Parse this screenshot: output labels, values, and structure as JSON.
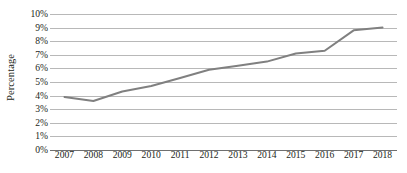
{
  "chart_data": {
    "type": "line",
    "title": "",
    "subtitle": "",
    "xlabel": "",
    "ylabel": "Percentage",
    "categories": [
      "2007",
      "2008",
      "2009",
      "2010",
      "2011",
      "2012",
      "2013",
      "2014",
      "2015",
      "2016",
      "2017",
      "2018"
    ],
    "values": [
      3.9,
      3.6,
      4.3,
      4.7,
      5.3,
      5.9,
      6.2,
      6.5,
      7.1,
      7.3,
      8.8,
      9.0
    ],
    "series": [
      {
        "name": "Percentage",
        "values": [
          3.9,
          3.6,
          4.3,
          4.7,
          5.3,
          5.9,
          6.2,
          6.5,
          7.1,
          7.3,
          8.8,
          9.0
        ]
      }
    ],
    "ylim": [
      0,
      10
    ],
    "ytick_values": [
      0,
      1,
      2,
      3,
      4,
      5,
      6,
      7,
      8,
      9,
      10
    ],
    "ytick_labels": [
      "0%",
      "1%",
      "2%",
      "3%",
      "4%",
      "5%",
      "6%",
      "7%",
      "8%",
      "9%",
      "10%"
    ],
    "grid": true,
    "grid_axis": "y",
    "legend": false,
    "legend_position": "none",
    "line_color": "#808080",
    "grid_color": "#b8b8b8",
    "axis_color": "#6f6f6f",
    "text_color": "#231f20",
    "background_color": "#ffffff",
    "line_width": 2.0,
    "markers": false,
    "annotations": []
  }
}
